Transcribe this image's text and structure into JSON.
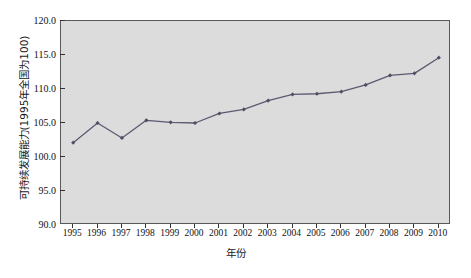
{
  "chart_data": {
    "type": "line",
    "title": "",
    "xlabel": "年份",
    "ylabel": "可持续发展能力(1995年全国为100)",
    "x": [
      1995,
      1996,
      1997,
      1998,
      1999,
      2000,
      2001,
      2002,
      2003,
      2004,
      2005,
      2006,
      2007,
      2008,
      2009,
      2010
    ],
    "categories": [
      "1995",
      "1996",
      "1997",
      "1998",
      "1999",
      "2000",
      "2001",
      "2002",
      "2003",
      "2004",
      "2005",
      "2006",
      "2007",
      "2008",
      "2009",
      "2010"
    ],
    "values": [
      102.1,
      105.0,
      102.8,
      105.4,
      105.1,
      105.0,
      106.4,
      107.0,
      108.3,
      109.2,
      109.3,
      109.6,
      110.6,
      112.0,
      112.3,
      114.6
    ],
    "series": [
      {
        "name": "可持续发展能力",
        "values": [
          102.1,
          105.0,
          102.8,
          105.4,
          105.1,
          105.0,
          106.4,
          107.0,
          108.3,
          109.2,
          109.3,
          109.6,
          110.6,
          112.0,
          112.3,
          114.6
        ]
      }
    ],
    "ylim": [
      90.0,
      120.0
    ],
    "yticks": [
      "90.0",
      "95.0",
      "100.0",
      "105.0",
      "110.0",
      "115.0",
      "120.0"
    ],
    "ytick_values": [
      90.0,
      95.0,
      100.0,
      105.0,
      110.0,
      115.0,
      120.0
    ],
    "xlim": [
      1994.5,
      2010.5
    ],
    "grid": false,
    "legend": "none",
    "marker": "diamond",
    "line_color": "#5a5a72",
    "marker_color": "#4e4e66",
    "plot_background": "#dcdcdc",
    "frame_color": "#595959"
  }
}
